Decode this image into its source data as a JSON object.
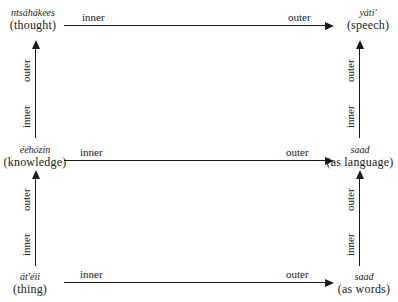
{
  "diagram": {
    "nodes": {
      "top_left": {
        "term": "ntsáhákees",
        "gloss": "(thought)"
      },
      "top_right": {
        "term": "yáti'",
        "gloss": "(speech)"
      },
      "mid_left": {
        "term": "ééhózin",
        "gloss": "(knowledge)"
      },
      "mid_right": {
        "term": "saad",
        "gloss": "(as language)"
      },
      "bot_left": {
        "term": "át'éii",
        "gloss": "(thing)"
      },
      "bot_right": {
        "term": "saad",
        "gloss": "(as words)"
      }
    },
    "horizontal_arrows": [
      {
        "from": "thought",
        "to": "speech",
        "start_label": "inner",
        "end_label": "outer"
      },
      {
        "from": "knowledge",
        "to": "as language",
        "start_label": "inner",
        "end_label": "outer"
      },
      {
        "from": "thing",
        "to": "as words",
        "start_label": "inner",
        "end_label": "outer"
      }
    ],
    "vertical_arrows": [
      {
        "from": "knowledge",
        "to": "thought",
        "start_label": "inner",
        "end_label": "outer"
      },
      {
        "from": "thing",
        "to": "knowledge",
        "start_label": "inner",
        "end_label": "outer"
      },
      {
        "from": "as language",
        "to": "speech",
        "start_label": "inner",
        "end_label": "outer"
      },
      {
        "from": "as words",
        "to": "as language",
        "start_label": "inner",
        "end_label": "outer"
      }
    ]
  }
}
